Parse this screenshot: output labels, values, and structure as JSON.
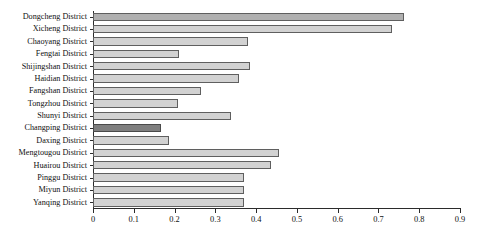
{
  "chart_data": {
    "type": "bar",
    "orientation": "horizontal",
    "title": "",
    "subtitle": "",
    "xlabel": "",
    "ylabel": "",
    "xlim": [
      0,
      0.9
    ],
    "ylim": null,
    "grid": false,
    "legend": null,
    "legend_position": "none",
    "xticks": [
      "0",
      "0.1",
      "0.2",
      "0.3",
      "0.4",
      "0.5",
      "0.6",
      "0.7",
      "0.8",
      "0.9"
    ],
    "xtick_values": [
      0,
      0.1,
      0.2,
      0.3,
      0.4,
      0.5,
      0.6,
      0.7,
      0.8,
      0.9
    ],
    "categories": [
      "Dongcheng District",
      "Xicheng District",
      "Chaoyang District",
      "Fengtai District",
      "Shijingshan District",
      "Haidian District",
      "Fangshan District",
      "Tongzhou District",
      "Shunyi District",
      "Changping District",
      "Daxing District",
      "Mengtougou District",
      "Huairou District",
      "Pinggu District",
      "Miyun District",
      "Yanqing District"
    ],
    "values": [
      0.762,
      0.733,
      0.379,
      0.21,
      0.385,
      0.358,
      0.266,
      0.208,
      0.338,
      0.167,
      0.187,
      0.456,
      0.436,
      0.371,
      0.37,
      0.37
    ],
    "bar_styles": [
      "medium",
      "light",
      "light",
      "light",
      "light",
      "light",
      "light",
      "light",
      "light",
      "dark",
      "light",
      "light",
      "light",
      "light",
      "light",
      "light"
    ],
    "colors": {
      "bar_light": "#d2d2d2",
      "bar_medium": "#b0b0b0",
      "bar_highlight": "#7f7f7f",
      "bar_edge": "#5f5f5f",
      "axis": "#2b2b2b",
      "text": "#111111",
      "background": "#ffffff"
    }
  }
}
